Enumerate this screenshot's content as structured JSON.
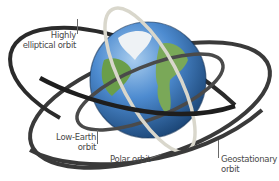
{
  "diagram": {
    "labels": {
      "highly_elliptical": [
        "Highly",
        "elliptical orbit"
      ],
      "low_earth": [
        "Low-Earth",
        "orbit"
      ],
      "polar": "Polar orbit",
      "geostationary": [
        "Geostationary",
        "orbit"
      ]
    },
    "colors": {
      "ocean": "#3f7fc8",
      "ocean_dark": "#1d4f8f",
      "land": "#6a9e4a",
      "ice": "#f2f4f6",
      "orbit_dark": "#2b2b2b",
      "orbit_mid": "#555555",
      "orbit_polar": "#d9d7cc",
      "text": "#4a4a4a"
    }
  }
}
